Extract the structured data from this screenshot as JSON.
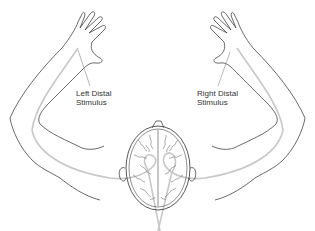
{
  "diagram": {
    "labels": {
      "left": {
        "line1": "Left Distal",
        "line2": "Stimulus"
      },
      "right": {
        "line1": "Right Distal",
        "line2": "Stimulus"
      }
    },
    "colors": {
      "outline": "#444444",
      "pathway": "#c8c8c8",
      "text": "#333333",
      "background": "#ffffff"
    }
  }
}
